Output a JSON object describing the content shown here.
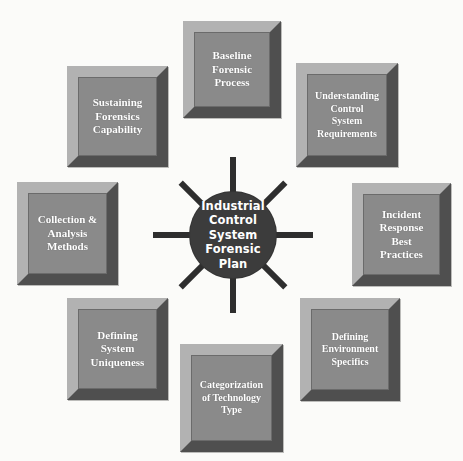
{
  "diagram": {
    "title": "Industrial Control System Forensic Plan",
    "type": "hub-and-spoke",
    "background_color": "#fbfbf9",
    "hub": {
      "label": "Industrial\nControl\nSystem\nForensic Plan",
      "fill_color": "#3c3c3c",
      "text_color": "#ffffff",
      "center_x": 233,
      "center_y": 235,
      "diameter": 86
    },
    "connector": {
      "color": "#2e2e2e",
      "thickness": 6
    },
    "node_style": {
      "face_color": "#8a8a8a",
      "bevel_light_color": "#b2b2b2",
      "bevel_dark_color": "#4f4f4f",
      "text_color": "#ffffff"
    },
    "nodes": [
      {
        "id": "baseline-forensic-process",
        "label": "Baseline\nForensic\nProcess",
        "position": "top",
        "x": 183,
        "y": 21,
        "w": 98,
        "h": 97,
        "angle_deg": 270
      },
      {
        "id": "understanding-control-system-requirements",
        "label": "Understanding\nControl\nSystem\nRequirements",
        "position": "top-right",
        "x": 296,
        "y": 63,
        "w": 102,
        "h": 104,
        "angle_deg": 315,
        "small": true
      },
      {
        "id": "incident-response-best-practices",
        "label": "Incident\nResponse\nBest\nPractices",
        "position": "right",
        "x": 352,
        "y": 183,
        "w": 99,
        "h": 103,
        "angle_deg": 0
      },
      {
        "id": "defining-environment-specifics",
        "label": "Defining\nEnvironment\nSpecifics",
        "position": "bottom-right",
        "x": 300,
        "y": 298,
        "w": 100,
        "h": 103,
        "angle_deg": 45,
        "small": true
      },
      {
        "id": "categorization-of-technology-type",
        "label": "Categorization\nof Technology\nType",
        "position": "bottom",
        "x": 180,
        "y": 344,
        "w": 103,
        "h": 108,
        "angle_deg": 90,
        "small": true
      },
      {
        "id": "defining-system-uniqueness",
        "label": "Defining\nSystem\nUniqueness",
        "position": "bottom-left",
        "x": 67,
        "y": 298,
        "w": 101,
        "h": 102,
        "angle_deg": 135
      },
      {
        "id": "collection-analysis-methods",
        "label": "Collection &\nAnalysis\nMethods",
        "position": "left",
        "x": 17,
        "y": 182,
        "w": 101,
        "h": 103,
        "angle_deg": 180
      },
      {
        "id": "sustaining-forensics-capability",
        "label": "Sustaining\nForensics\nCapability",
        "position": "top-left",
        "x": 67,
        "y": 66,
        "w": 101,
        "h": 101,
        "angle_deg": 225
      }
    ],
    "spokes": [
      {
        "id": "spoke-top",
        "angle_deg": 270,
        "length": 78
      },
      {
        "id": "spoke-top-right",
        "angle_deg": 315,
        "length": 74
      },
      {
        "id": "spoke-right",
        "angle_deg": 0,
        "length": 80
      },
      {
        "id": "spoke-bottom-right",
        "angle_deg": 45,
        "length": 74
      },
      {
        "id": "spoke-bottom",
        "angle_deg": 90,
        "length": 78
      },
      {
        "id": "spoke-bottom-left",
        "angle_deg": 135,
        "length": 74
      },
      {
        "id": "spoke-left",
        "angle_deg": 180,
        "length": 80
      },
      {
        "id": "spoke-top-left",
        "angle_deg": 225,
        "length": 74
      }
    ]
  }
}
